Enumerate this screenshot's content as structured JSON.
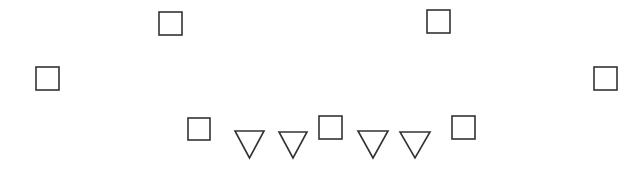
{
  "canvas": {
    "width": 637,
    "height": 177,
    "background": "#ffffff",
    "stroke": "#333333"
  },
  "squares": [
    {
      "id": "square-top-left",
      "x": 159,
      "y": 12,
      "size": 23
    },
    {
      "id": "square-top-right",
      "x": 427,
      "y": 10,
      "size": 23
    },
    {
      "id": "square-mid-left",
      "x": 36,
      "y": 67,
      "size": 23
    },
    {
      "id": "square-mid-right",
      "x": 594,
      "y": 67,
      "size": 23
    },
    {
      "id": "square-bottom-1",
      "x": 188,
      "y": 118,
      "size": 22
    },
    {
      "id": "square-bottom-2",
      "x": 319,
      "y": 116,
      "size": 23
    },
    {
      "id": "square-bottom-3",
      "x": 452,
      "y": 116,
      "size": 23
    }
  ],
  "triangles": [
    {
      "id": "triangle-down-1",
      "x1": 235,
      "x2": 264,
      "top": 131,
      "bottom": 158
    },
    {
      "id": "triangle-down-2",
      "x1": 279,
      "x2": 307,
      "top": 132,
      "bottom": 158
    },
    {
      "id": "triangle-down-3",
      "x1": 358,
      "x2": 388,
      "top": 131,
      "bottom": 158
    },
    {
      "id": "triangle-down-4",
      "x1": 400,
      "x2": 430,
      "top": 132,
      "bottom": 158
    }
  ]
}
